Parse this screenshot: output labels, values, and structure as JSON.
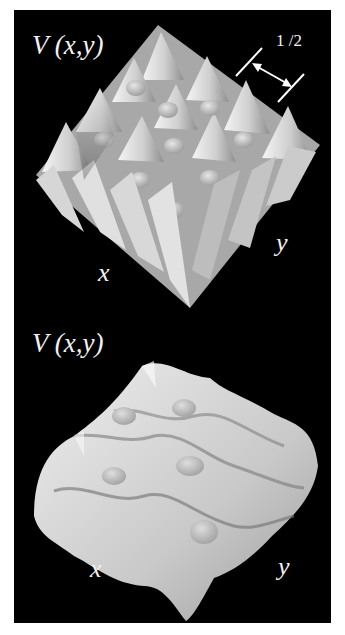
{
  "figure": {
    "background": "#000000",
    "surface_color": "#d9d9d9",
    "panels": [
      {
        "id": "top",
        "title": "V (x,y)",
        "x_axis_label": "x",
        "y_axis_label": "y",
        "scale_annotation": "1 /2",
        "description": "Deep 2D lattice potential: grid of sharp conical peaks (about 5x5) with rounded saddles between them"
      },
      {
        "id": "bottom",
        "title": "V (x,y)",
        "x_axis_label": "x",
        "y_axis_label": "y",
        "description": "Shallower, smoother lattice potential: rounded ridges and bumps forming a corrugated surface"
      }
    ]
  }
}
